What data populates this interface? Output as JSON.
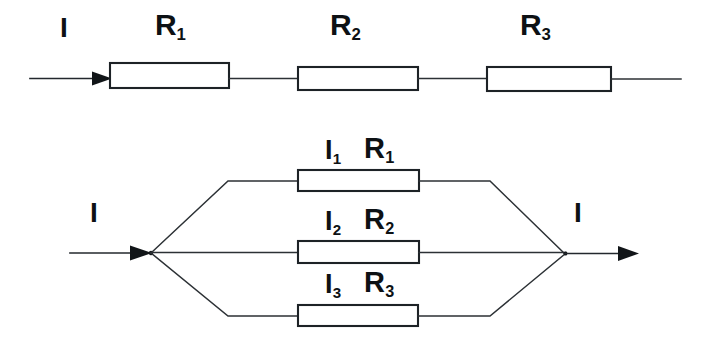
{
  "diagram": {
    "background_color": "#ffffff",
    "line_color": "#23282d",
    "text_color": "#0d1114"
  },
  "series_circuit": {
    "name": "series-circuit",
    "current_label": "I",
    "resistors": [
      {
        "label_main": "R",
        "label_sub": "1"
      },
      {
        "label_main": "R",
        "label_sub": "2"
      },
      {
        "label_main": "R",
        "label_sub": "3"
      }
    ]
  },
  "parallel_circuit": {
    "name": "parallel-circuit",
    "input_current_label": "I",
    "output_current_label": "I",
    "branches": [
      {
        "current_main": "I",
        "current_sub": "1",
        "resistor_main": "R",
        "resistor_sub": "1"
      },
      {
        "current_main": "I",
        "current_sub": "2",
        "resistor_main": "R",
        "resistor_sub": "2"
      },
      {
        "current_main": "I",
        "current_sub": "3",
        "resistor_main": "R",
        "resistor_sub": "3"
      }
    ]
  }
}
